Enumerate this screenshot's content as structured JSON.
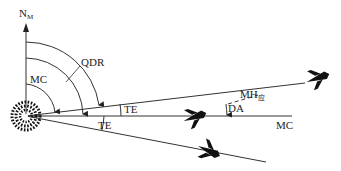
{
  "diagram": {
    "type": "navigation-bearing-geometry",
    "labels": {
      "north": "N",
      "north_sub": "M",
      "qdr": "QDR",
      "mc_arc": "MC",
      "te_upper": "TE",
      "te_lower": "TE",
      "mh": "MH",
      "mh_sub": "应",
      "da": "DA",
      "mc_line": "MC"
    },
    "elements": [
      "beacon",
      "north-axis",
      "magnetic-course-line",
      "upper-track-line",
      "lower-track-line",
      "aircraft-upper",
      "aircraft-middle",
      "aircraft-lower"
    ],
    "colors": {
      "line": "#333333",
      "aircraft": "#111111",
      "background": "#ffffff"
    }
  }
}
